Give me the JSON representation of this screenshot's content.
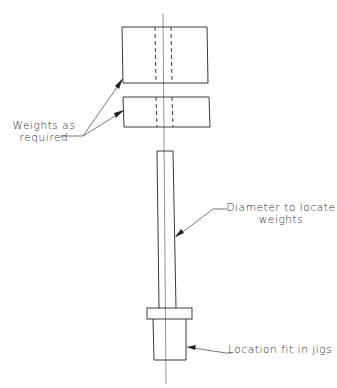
{
  "diagram": {
    "parts": [
      {
        "name": "top-weight",
        "shape": "rectangle",
        "hidden_bore": true
      },
      {
        "name": "second-weight",
        "shape": "rectangle",
        "hidden_bore": true
      },
      {
        "name": "shaft",
        "shape": "rectangle"
      },
      {
        "name": "collar",
        "shape": "rectangle"
      },
      {
        "name": "location-spigot",
        "shape": "rectangle"
      },
      {
        "name": "centerline",
        "shape": "line"
      }
    ],
    "labels": {
      "weights": {
        "line1": "Weights as",
        "line2": "required"
      },
      "diameter": {
        "line1": "Diameter to locate",
        "line2": "weights"
      },
      "location": {
        "line1": "Location fit in jigs"
      }
    },
    "colors": {
      "line": "#3a3a3a",
      "centerline": "#7a7a7a",
      "text": "#2a2a2a",
      "background": "#ffffff"
    }
  }
}
